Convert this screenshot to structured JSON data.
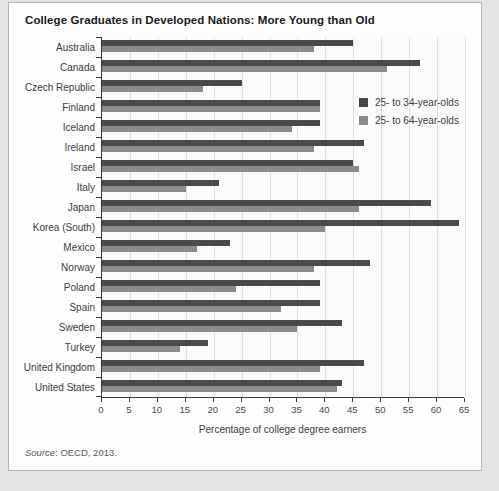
{
  "title": "College Graduates in Developed Nations: More Young than Old",
  "source": {
    "label": "Source",
    "rest": ": OECD, 2013."
  },
  "legend": {
    "young_label": "25- to 34-year-olds",
    "old_label": "25- to 64-year-olds"
  },
  "colors": {
    "young_bar": "#4a4a48",
    "old_bar": "#8c8b89",
    "gridline": "#dedede",
    "axis": "#3a3a3a"
  },
  "chart_data": {
    "type": "bar",
    "orientation": "horizontal",
    "title": "College Graduates in Developed Nations: More Young than Old",
    "xlabel": "Percentage of college degree earners",
    "ylabel": "",
    "xlim": [
      0,
      65
    ],
    "xticks": [
      0,
      5,
      10,
      15,
      20,
      25,
      30,
      35,
      40,
      45,
      50,
      55,
      60,
      65
    ],
    "grid": "vertical",
    "legend_position": "upper-right-inside",
    "categories": [
      "Australia",
      "Canada",
      "Czech Republic",
      "Finland",
      "Iceland",
      "Ireland",
      "Israel",
      "Italy",
      "Japan",
      "Korea (South)",
      "Mexico",
      "Norway",
      "Poland",
      "Spain",
      "Sweden",
      "Turkey",
      "United Kingdom",
      "United States"
    ],
    "series": [
      {
        "name": "25- to 34-year-olds",
        "color": "#4a4a48",
        "values": [
          45,
          57,
          25,
          39,
          39,
          47,
          45,
          21,
          59,
          64,
          23,
          48,
          39,
          39,
          43,
          19,
          47,
          43
        ]
      },
      {
        "name": "25- to 64-year-olds",
        "color": "#8c8b89",
        "values": [
          38,
          51,
          18,
          39,
          34,
          38,
          46,
          15,
          46,
          40,
          17,
          38,
          24,
          32,
          35,
          14,
          39,
          42
        ]
      }
    ]
  }
}
